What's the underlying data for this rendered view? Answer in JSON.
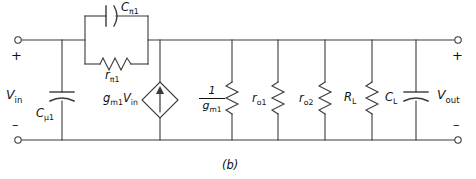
{
  "figure": {
    "caption": "(b)"
  },
  "terminals": {
    "input": {
      "voltage_label": "V",
      "voltage_sub": "in",
      "plus": "+",
      "minus": "–"
    },
    "output": {
      "voltage_label": "V",
      "voltage_sub": "out",
      "plus": "+",
      "minus": "–"
    }
  },
  "components": [
    {
      "id": "c-mu1",
      "type": "capacitor",
      "label": "C",
      "sub": "μ1",
      "orientation": "vertical"
    },
    {
      "id": "c-pi1",
      "type": "capacitor",
      "label": "C",
      "sub": "π1",
      "orientation": "horizontal"
    },
    {
      "id": "r-pi1",
      "type": "resistor",
      "label": "r",
      "sub": "π1",
      "orientation": "horizontal"
    },
    {
      "id": "gm1vin",
      "type": "current-source",
      "label": "g",
      "sub": "m1",
      "label2": "V",
      "sub2": "in",
      "orientation": "vertical"
    },
    {
      "id": "inv-gm1",
      "type": "resistor",
      "numerator": "1",
      "denominator": "g",
      "den_sub": "m1",
      "orientation": "vertical"
    },
    {
      "id": "r-o1",
      "type": "resistor",
      "label": "r",
      "sub": "o1",
      "orientation": "vertical"
    },
    {
      "id": "r-o2",
      "type": "resistor",
      "label": "r",
      "sub": "o2",
      "orientation": "vertical"
    },
    {
      "id": "r-l",
      "type": "resistor",
      "label": "R",
      "sub": "L",
      "orientation": "vertical"
    },
    {
      "id": "c-l",
      "type": "capacitor",
      "label": "C",
      "sub": "L",
      "orientation": "vertical"
    }
  ],
  "style": {
    "wire_color": "#3a3a3a",
    "text_color": "#111111",
    "background": "#ffffff"
  }
}
